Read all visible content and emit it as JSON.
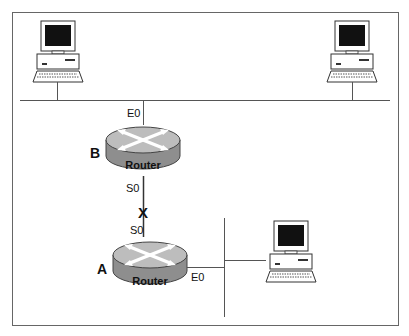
{
  "diagram": {
    "type": "network-topology",
    "nodes": [
      {
        "id": "pc-top-left",
        "kind": "workstation"
      },
      {
        "id": "pc-top-right",
        "kind": "workstation"
      },
      {
        "id": "router-b",
        "kind": "router",
        "label": "B",
        "device_text": "Router",
        "interfaces": [
          "E0",
          "S0"
        ]
      },
      {
        "id": "router-a",
        "kind": "router",
        "label": "A",
        "device_text": "Router",
        "interfaces": [
          "S0",
          "E0"
        ]
      },
      {
        "id": "pc-bottom-right",
        "kind": "workstation"
      }
    ],
    "links": [
      {
        "from": "pc-top-left",
        "to": "top-lan"
      },
      {
        "from": "pc-top-right",
        "to": "top-lan"
      },
      {
        "from": "router-b",
        "to": "top-lan",
        "interface": "E0"
      },
      {
        "from": "router-b",
        "to": "router-a",
        "interface_from": "S0",
        "interface_to": "S0",
        "status": "failed",
        "marker": "X"
      },
      {
        "from": "router-a",
        "to": "bottom-lan",
        "interface": "E0"
      },
      {
        "from": "pc-bottom-right",
        "to": "bottom-lan"
      }
    ]
  },
  "labels": {
    "router_b_name": "B",
    "router_a_name": "A",
    "router_text": "Router",
    "router_b_e0": "E0",
    "router_b_s0": "S0",
    "router_a_s0": "S0",
    "router_a_e0": "E0",
    "link_fail_marker": "X"
  },
  "colors": {
    "router_top": "#b8b8b8",
    "router_side": "#8e8e8e",
    "screen": "#111111",
    "line": "#555555",
    "frame": "#666666"
  }
}
